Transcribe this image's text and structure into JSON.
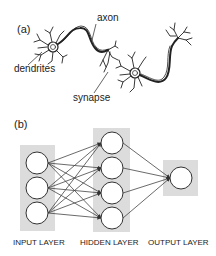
{
  "panel_a": {
    "label": "(a)",
    "annotations": {
      "axon": "axon",
      "dendrites": "dendrites",
      "synapse": "synapse"
    }
  },
  "panel_b": {
    "label": "(b)",
    "layers": [
      {
        "name": "INPUT LAYER",
        "nodes": 3
      },
      {
        "name": "HIDDEN LAYER",
        "nodes": 4
      },
      {
        "name": "OUTPUT LAYER",
        "nodes": 1
      }
    ],
    "colors": {
      "layer_box": "#dcdcdc",
      "node_fill": "#ffffff",
      "edge": "#444444"
    }
  }
}
